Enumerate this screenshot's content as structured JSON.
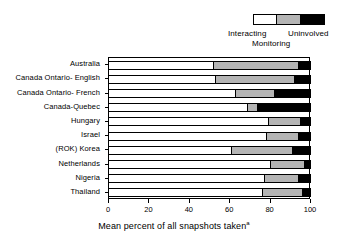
{
  "legend": {
    "items": [
      {
        "label": "Interacting",
        "color": "#ffffff",
        "name": "legend-swatch-interacting"
      },
      {
        "label": "Monitoring",
        "color": "#b4b4b4",
        "name": "legend-swatch-monitoring"
      },
      {
        "label": "Uninvolved",
        "color": "#000000",
        "name": "legend-swatch-uninvolved"
      }
    ],
    "interacting_label": "Interacting",
    "monitoring_label": "Monitoring",
    "uninvolved_label": "Uninvolved"
  },
  "axis": {
    "x_title": "Mean percent of all snapshots taken",
    "x_title_superscript": "a",
    "x_ticks": [
      "0",
      "20",
      "40",
      "60",
      "80",
      "100"
    ]
  },
  "chart_data": {
    "type": "bar",
    "orientation": "horizontal",
    "stacked": true,
    "title": "",
    "xlabel": "Mean percent of all snapshots taken",
    "ylabel": "",
    "xlim": [
      0,
      100
    ],
    "xticks": [
      0,
      20,
      40,
      60,
      80,
      100
    ],
    "grid": false,
    "legend_position": "top-right",
    "categories": [
      "Australia",
      "Canada Ontario-  English",
      "Canada Ontario-  French",
      "Canada-Quebec",
      "Hungary",
      "Israel",
      "(ROK) Korea",
      "Netherlands",
      "Nigeria",
      "Thailand"
    ],
    "series": [
      {
        "name": "Interacting",
        "color": "#ffffff",
        "values": [
          52,
          53,
          63,
          69,
          79,
          78,
          61,
          80,
          77,
          76
        ]
      },
      {
        "name": "Monitoring",
        "color": "#b4b4b4",
        "values": [
          42,
          39,
          19,
          5,
          16,
          16,
          30,
          17,
          17,
          20
        ]
      },
      {
        "name": "Uninvolved",
        "color": "#000000",
        "values": [
          6,
          8,
          18,
          26,
          5,
          6,
          9,
          3,
          6,
          4
        ]
      }
    ]
  }
}
